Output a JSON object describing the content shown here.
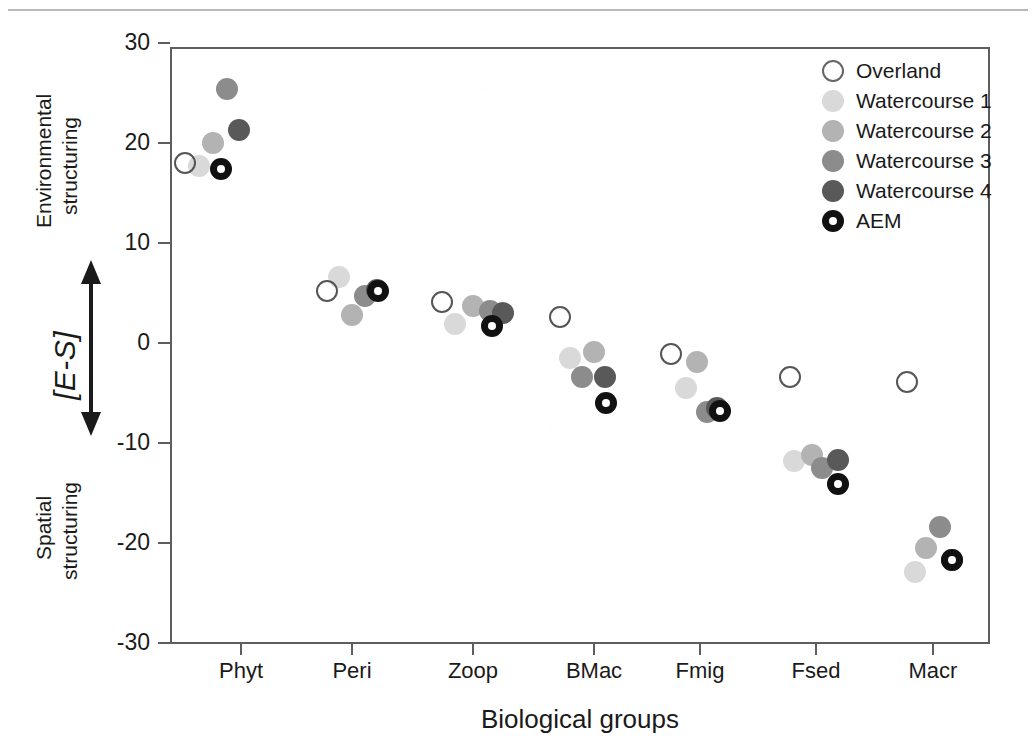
{
  "chart_data": {
    "type": "scatter",
    "title": "",
    "xlabel": "Biological groups",
    "ylabel": "[E-S]",
    "ylabel_top_annotation": "Environmental structuring",
    "ylabel_bottom_annotation": "Spatial structuring",
    "categories": [
      "Phyt",
      "Peri",
      "Zoop",
      "BMac",
      "Fmig",
      "Fsed",
      "Macr"
    ],
    "ylim": [
      -30,
      30
    ],
    "yticks": [
      30,
      20,
      10,
      0,
      -10,
      -20,
      -30
    ],
    "ytick_labels": [
      "30",
      "20",
      "10",
      "0",
      "-10",
      "-20",
      "-30"
    ],
    "grid": false,
    "legend_position": "top-right",
    "series": [
      {
        "name": "Overland",
        "marker": "open-circle",
        "color": "#ffffff",
        "edge_color": "#555555",
        "values": [
          18.0,
          5.2,
          4.1,
          2.6,
          -1.1,
          -3.4,
          -3.9
        ]
      },
      {
        "name": "Watercourse 1",
        "marker": "filled-circle",
        "color": "#d9d9d9",
        "values": [
          17.7,
          6.6,
          1.9,
          -1.5,
          -4.5,
          -11.8,
          -22.9
        ]
      },
      {
        "name": "Watercourse 2",
        "marker": "filled-circle",
        "color": "#b3b3b3",
        "values": [
          20.0,
          2.8,
          3.7,
          -0.9,
          -1.9,
          -11.2,
          -20.5
        ]
      },
      {
        "name": "Watercourse 3",
        "marker": "filled-circle",
        "color": "#8c8c8c",
        "values": [
          25.4,
          4.7,
          3.2,
          -3.4,
          -6.9,
          -12.5,
          -18.4
        ]
      },
      {
        "name": "Watercourse 4",
        "marker": "filled-circle",
        "color": "#595959",
        "values": [
          21.3,
          5.3,
          3.0,
          -3.4,
          -6.5,
          -11.7,
          -21.7
        ]
      },
      {
        "name": "AEM",
        "marker": "bullseye-circle",
        "color": "#111111",
        "inner_color": "#ffffff",
        "values": [
          17.4,
          5.2,
          1.7,
          -6.0,
          -6.8,
          -14.1,
          -21.7
        ]
      }
    ],
    "series_x_offsets_px": [
      -26,
      -14,
      0,
      14,
      26,
      27
    ],
    "point_overrides": {
      "note": "per-point pixel x jitter matching the original figure",
      "jitter": [
        [
          0,
          0,
          0,
          0,
          0,
          0
        ],
        [
          0,
          0,
          0,
          0,
          0,
          0
        ],
        [
          0,
          0,
          0,
          0,
          0,
          0
        ],
        [
          0,
          0,
          0,
          0,
          0,
          0
        ],
        [
          0,
          0,
          0,
          0,
          0,
          0
        ],
        [
          0,
          0,
          0,
          0,
          0,
          0
        ],
        [
          0,
          0,
          0,
          0,
          0,
          0
        ]
      ]
    }
  },
  "legend": {
    "items": [
      {
        "label": "Overland",
        "swatch": "#ffffff",
        "border": "#666666",
        "style": "open"
      },
      {
        "label": "Watercourse 1",
        "swatch": "#d9d9d9",
        "border": "#d9d9d9",
        "style": "fill"
      },
      {
        "label": "Watercourse 2",
        "swatch": "#b3b3b3",
        "border": "#b3b3b3",
        "style": "fill"
      },
      {
        "label": "Watercourse 3",
        "swatch": "#8c8c8c",
        "border": "#8c8c8c",
        "style": "fill"
      },
      {
        "label": "Watercourse 4",
        "swatch": "#595959",
        "border": "#595959",
        "style": "fill"
      },
      {
        "label": "AEM",
        "swatch": "#111111",
        "border": "#111111",
        "style": "bullseye"
      }
    ]
  },
  "axes": {
    "x_title": "Biological groups",
    "y_title": "[E-S]",
    "y_top_label_line1": "Environmental",
    "y_top_label_line2": "structuring",
    "y_bottom_label_line1": "Spatial",
    "y_bottom_label_line2": "structuring"
  },
  "style": {
    "axis_color": "#5e5e5e",
    "text_color": "#1a1a1a",
    "background": "#ffffff"
  }
}
